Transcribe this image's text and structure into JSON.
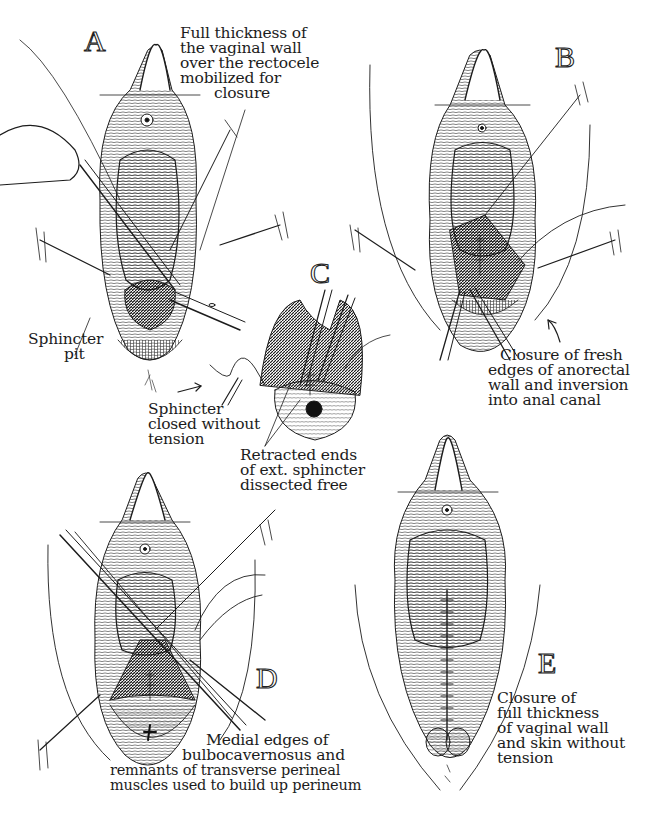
{
  "figure": {
    "background": "#ffffff",
    "ink_color": "#1c1c1c",
    "panels": [
      {
        "id": "A",
        "letter": "A",
        "caption_lines": [
          "Full thickness of",
          "the vaginal wall",
          "over the rectocele",
          "mobilized for",
          "closure"
        ],
        "secondary_label_lines": [
          "Sphincter",
          "pit"
        ]
      },
      {
        "id": "B",
        "letter": "B",
        "caption_lines": [
          "Closure of fresh",
          "edges of anorectal",
          "wall and inversion",
          "into anal canal"
        ]
      },
      {
        "id": "C",
        "letter": "C",
        "caption_lines": [
          "Sphincter",
          "closed without",
          "tension"
        ],
        "secondary_label_lines": [
          "Retracted ends",
          "of ext. sphincter",
          "dissected free"
        ]
      },
      {
        "id": "D",
        "letter": "D",
        "caption_lines": [
          "Medial edges of",
          "bulbocavernosus and",
          "remnants of transverse perineal",
          "muscles used to build up perineum"
        ]
      },
      {
        "id": "E",
        "letter": "E",
        "caption_lines": [
          "Closure of",
          "full thickness",
          "of vaginal wall",
          "and skin without",
          "tension"
        ]
      }
    ]
  }
}
